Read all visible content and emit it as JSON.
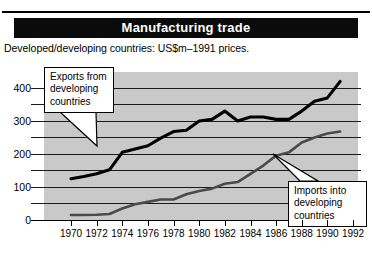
{
  "header": {
    "title": "Manufacturing trade",
    "subtitle": "Developed/developing countries: US$m–1991 prices."
  },
  "annotations": {
    "exports": {
      "line1": "Exports from",
      "line2": "developing",
      "line3": "countries"
    },
    "imports": {
      "line1": "Imports into",
      "line2": "developing",
      "line3": "countries"
    }
  },
  "axis": {
    "y_ticks": [
      "400",
      "300",
      "200",
      "100",
      "0"
    ],
    "x_ticks": [
      "1970",
      "1972",
      "1974",
      "1976",
      "1978",
      "1980",
      "1982",
      "1984",
      "1986",
      "1988",
      "1990",
      "1992"
    ]
  },
  "colors": {
    "title_bar": "#0b0b0b",
    "plot_background": "#c9c9c9",
    "exports_line": "#000000",
    "imports_line": "#4a4a4a",
    "gridline": "#1a1a1a"
  },
  "chart_data": {
    "type": "line",
    "title": "Manufacturing trade",
    "subtitle": "Developed/developing countries: US$m–1991 prices.",
    "xlabel": "",
    "ylabel": "",
    "xlim": [
      1970,
      1992
    ],
    "ylim": [
      0,
      430
    ],
    "y_ticks": [
      0,
      100,
      200,
      300,
      400
    ],
    "y_minor_step": 50,
    "x_ticks": [
      1970,
      1972,
      1974,
      1976,
      1978,
      1980,
      1982,
      1984,
      1986,
      1988,
      1990,
      1992
    ],
    "grid": true,
    "legend": "annotated-callouts",
    "series": [
      {
        "name": "Exports from developing countries",
        "color": "#000000",
        "x": [
          1970,
          1971,
          1972,
          1973,
          1974,
          1975,
          1976,
          1977,
          1978,
          1979,
          1980,
          1981,
          1982,
          1983,
          1984,
          1985,
          1986,
          1987,
          1988,
          1989,
          1990,
          1991
        ],
        "values": [
          125,
          132,
          140,
          152,
          205,
          215,
          225,
          248,
          268,
          272,
          300,
          305,
          330,
          300,
          312,
          312,
          305,
          305,
          330,
          360,
          370,
          420
        ]
      },
      {
        "name": "Imports into developing countries",
        "color": "#4a4a4a",
        "x": [
          1970,
          1971,
          1972,
          1973,
          1974,
          1975,
          1976,
          1977,
          1978,
          1979,
          1980,
          1981,
          1982,
          1983,
          1984,
          1985,
          1986,
          1987,
          1988,
          1989,
          1990,
          1991
        ],
        "values": [
          15,
          15,
          16,
          18,
          35,
          48,
          55,
          62,
          62,
          78,
          88,
          95,
          110,
          115,
          140,
          165,
          195,
          205,
          235,
          250,
          262,
          268
        ]
      }
    ]
  }
}
